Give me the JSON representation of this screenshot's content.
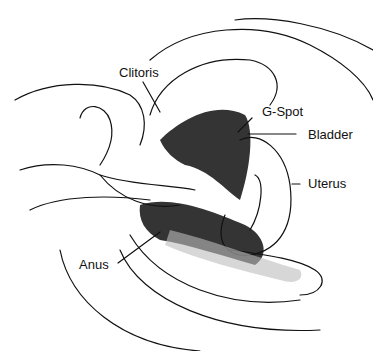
{
  "diagram": {
    "type": "anatomical-line-drawing",
    "labels": [
      {
        "id": "clitoris",
        "text": "Clitoris"
      },
      {
        "id": "g-spot",
        "text": "G-Spot"
      },
      {
        "id": "bladder",
        "text": "Bladder"
      },
      {
        "id": "uterus",
        "text": "Uterus"
      },
      {
        "id": "anus",
        "text": "Anus"
      }
    ],
    "colors": {
      "ink": "#111111",
      "background": "#ffffff",
      "shade": "#bdbdbd"
    }
  }
}
